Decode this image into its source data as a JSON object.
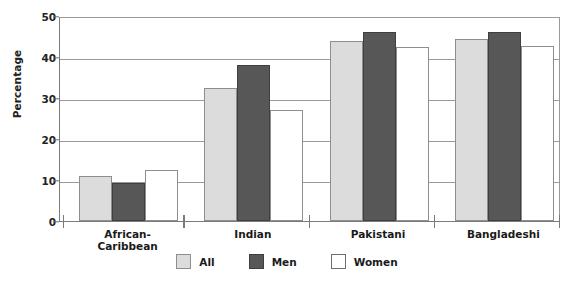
{
  "chart_data": {
    "type": "bar",
    "title": "",
    "xlabel": "",
    "ylabel": "Percentage",
    "ylim": [
      0,
      50
    ],
    "yticks": [
      0,
      10,
      20,
      30,
      40,
      50
    ],
    "grid": true,
    "legend_position": "bottom",
    "categories": [
      "African-\nCaribbean",
      "Indian",
      "Pakistani",
      "Bangladeshi"
    ],
    "series": [
      {
        "name": "All",
        "color": "#dcdcdc",
        "values": [
          11.0,
          32.5,
          44.0,
          44.3
        ]
      },
      {
        "name": "Men",
        "color": "#575757",
        "values": [
          9.3,
          38.0,
          46.0,
          46.0
        ]
      },
      {
        "name": "Women",
        "color": "#ffffff",
        "values": [
          12.5,
          27.0,
          42.5,
          42.7
        ]
      }
    ]
  },
  "axis": {
    "y_title": "Percentage",
    "tick_labels": [
      "0",
      "10",
      "20",
      "30",
      "40",
      "50"
    ]
  },
  "categories_display": [
    "African-\nCaribbean",
    "Indian",
    "Pakistani",
    "Bangladeshi"
  ],
  "legend": {
    "items": [
      {
        "label": "All"
      },
      {
        "label": "Men"
      },
      {
        "label": "Women"
      }
    ]
  }
}
